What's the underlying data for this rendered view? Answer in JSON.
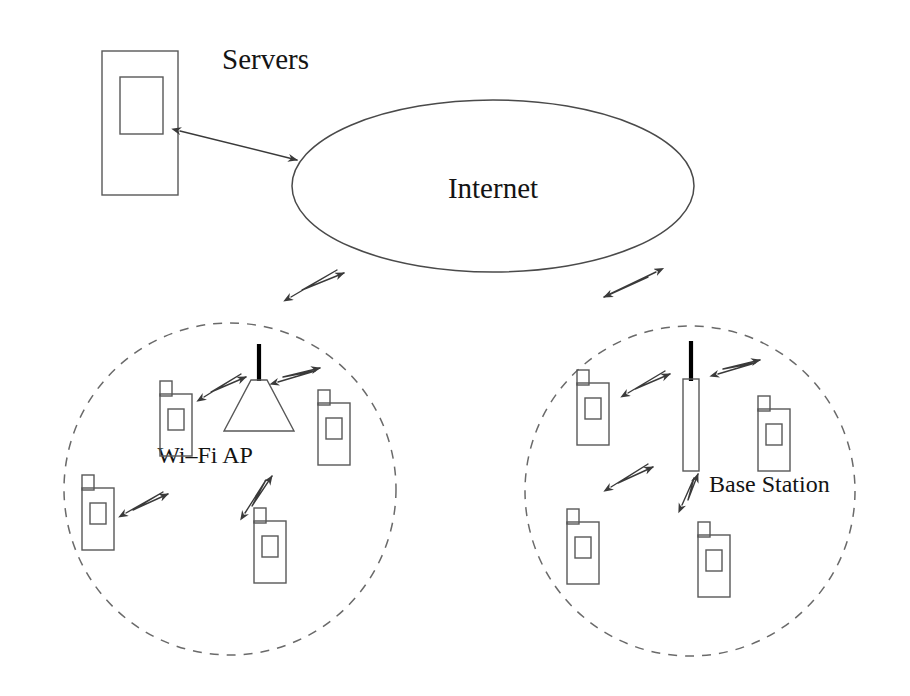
{
  "diagram": {
    "canvas": {
      "width": 910,
      "height": 696,
      "background": "#ffffff"
    },
    "colors": {
      "line": "#585858",
      "dashed": "#6a6a6a",
      "arrow": "#3a3a3a",
      "text": "#141414",
      "antenna": "#000000"
    },
    "labels": {
      "servers": "Servers",
      "internet": "Internet",
      "wifi_ap": "Wi–Fi AP",
      "base_station": "Base Station"
    },
    "nodes": [
      {
        "id": "servers",
        "type": "server-rack",
        "label": "Servers",
        "label_x": 222,
        "label_y": 62,
        "outer": {
          "x": 102,
          "y": 51,
          "w": 76,
          "h": 144
        },
        "inner": {
          "x": 120,
          "y": 77,
          "w": 43,
          "h": 57
        }
      },
      {
        "id": "internet",
        "type": "cloud-ellipse",
        "label": "Internet",
        "cx": 493,
        "cy": 186,
        "rx": 201,
        "ry": 86,
        "label_x": 493,
        "label_y": 198
      },
      {
        "id": "wifi-cell",
        "type": "coverage-cell",
        "label": "Wi–Fi AP",
        "cx": 230,
        "cy": 489,
        "r": 166,
        "label_x": 205,
        "label_y": 463,
        "access_point": {
          "type": "access-point",
          "cone": {
            "top_x": 259,
            "top_y": 379,
            "top_w": 16,
            "bottom_y": 430,
            "bottom_w": 70
          },
          "antenna": {
            "x": 259,
            "y1": 344,
            "y2": 380
          }
        },
        "devices": [
          {
            "id": "wifi-phone-1",
            "x": 160,
            "y": 381,
            "w": 32,
            "h": 62
          },
          {
            "id": "wifi-phone-2",
            "x": 318,
            "y": 403,
            "w": 32,
            "h": 62
          },
          {
            "id": "wifi-phone-3",
            "x": 82,
            "y": 488,
            "w": 32,
            "h": 62
          },
          {
            "id": "wifi-phone-4",
            "x": 254,
            "y": 521,
            "w": 32,
            "h": 62
          }
        ],
        "links": [
          {
            "id": "wifi-link-1",
            "x1": 206,
            "y1": 394,
            "x2": 243,
            "y2": 375
          },
          {
            "id": "wifi-link-2",
            "x1": 278,
            "y1": 378,
            "x2": 318,
            "y2": 393
          },
          {
            "id": "wifi-link-3",
            "x1": 126,
            "y1": 512,
            "x2": 165,
            "y2": 495
          },
          {
            "id": "wifi-link-4",
            "x1": 245,
            "y1": 512,
            "x2": 272,
            "y2": 478
          }
        ]
      },
      {
        "id": "cellular-cell",
        "type": "coverage-cell",
        "label": "Base Station",
        "cx": 690,
        "cy": 491,
        "r": 165,
        "label_x": 709,
        "label_y": 492,
        "access_point": {
          "type": "base-station",
          "tower": {
            "x": 683,
            "y": 379,
            "w": 16,
            "h": 92
          },
          "antenna": {
            "x": 691,
            "y1": 341,
            "y2": 381
          }
        },
        "devices": [
          {
            "id": "cell-phone-1",
            "x": 577,
            "y": 370,
            "w": 32,
            "h": 62
          },
          {
            "id": "cell-phone-2",
            "x": 758,
            "y": 396,
            "w": 32,
            "h": 62
          },
          {
            "id": "cell-phone-3",
            "x": 567,
            "y": 509,
            "w": 32,
            "h": 62
          },
          {
            "id": "cell-phone-4",
            "x": 698,
            "y": 522,
            "w": 32,
            "h": 62
          }
        ],
        "links": [
          {
            "id": "cell-link-1",
            "x1": 625,
            "y1": 391,
            "x2": 665,
            "y2": 373
          },
          {
            "id": "cell-link-2",
            "x1": 712,
            "y1": 370,
            "x2": 748,
            "y2": 384
          },
          {
            "id": "cell-link-3",
            "x1": 612,
            "y1": 486,
            "x2": 648,
            "y2": 466
          },
          {
            "id": "cell-link-4",
            "x1": 683,
            "y1": 502,
            "x2": 694,
            "y2": 476
          }
        ]
      }
    ],
    "connections": [
      {
        "id": "servers-internet-link",
        "type": "double-arrow",
        "from": "servers",
        "to": "internet",
        "x1": 180,
        "y1": 131,
        "x2": 297,
        "y2": 160
      },
      {
        "id": "internet-wifi-link",
        "type": "lightning-double-arrow",
        "from": "internet",
        "to": "wifi-cell",
        "x1": 290,
        "y1": 297,
        "x2": 345,
        "y2": 272
      },
      {
        "id": "internet-cellular-link",
        "type": "lightning-double-arrow",
        "from": "internet",
        "to": "cellular-cell",
        "x1": 601,
        "y1": 272,
        "x2": 656,
        "y2": 297
      }
    ]
  }
}
